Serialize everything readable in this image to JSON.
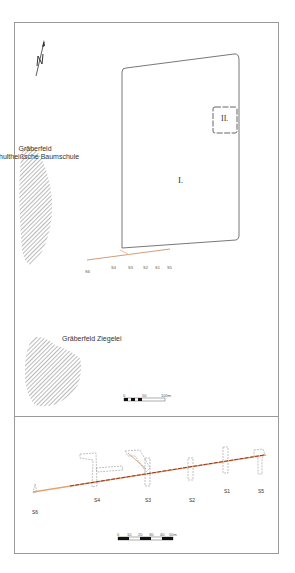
{
  "top_map": {
    "north_arrow": "N",
    "cemetery_1": {
      "line1": "Gräberfeld",
      "line2": "Schultheißsche Baumschule"
    },
    "cemetery_2": "Gräberfeld Ziegelei",
    "enclosure_1": "I.",
    "enclosure_2": "II.",
    "sections": [
      "S6",
      "S4",
      "S3",
      "S2",
      "S1",
      "S5"
    ],
    "scale": {
      "ticks": [
        "0",
        "50",
        "100m"
      ]
    }
  },
  "bottom_map": {
    "sections": [
      {
        "label": "S6"
      },
      {
        "label": "S4"
      },
      {
        "label": "S3"
      },
      {
        "label": "S2"
      },
      {
        "label": "S1"
      },
      {
        "label": "S5"
      }
    ],
    "scale": {
      "ticks": [
        "0",
        "10",
        "20",
        "30",
        "40",
        "50m"
      ]
    }
  },
  "colors": {
    "frame": "#9a9a9a",
    "outline": "#555555",
    "hatch": "#666666",
    "trench": "#c0703f",
    "trench_dark": "#8a2a14",
    "dashed": "#888888"
  }
}
